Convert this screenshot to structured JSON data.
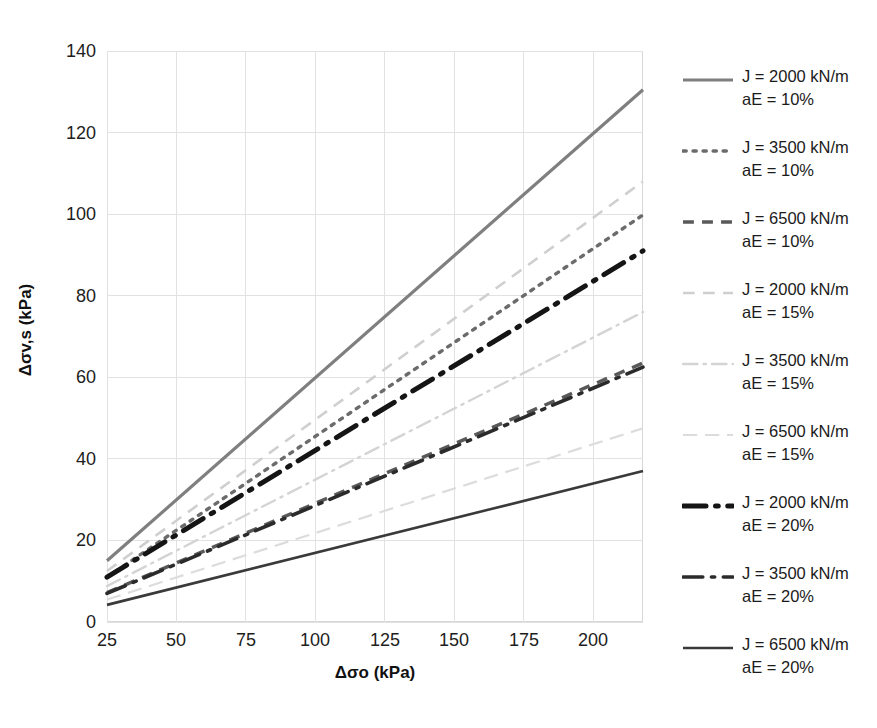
{
  "chart_data": {
    "type": "line",
    "title": "",
    "xlabel": "Δσo (kPa)",
    "ylabel": "Δσv,s (kPa)",
    "xlim": [
      25,
      218
    ],
    "ylim": [
      0,
      140
    ],
    "xticks": [
      25,
      50,
      75,
      100,
      125,
      150,
      175,
      200
    ],
    "yticks": [
      0,
      20,
      40,
      60,
      80,
      100,
      120,
      140
    ],
    "grid": true,
    "legend_position": "right",
    "x": [
      25,
      218
    ],
    "series": [
      {
        "name": "J = 2000 kN/m aE = 10%",
        "J": "2000 kN/m",
        "aE": "10%",
        "style": "solid",
        "color": "#7f7f7f",
        "width": 3.2,
        "values": [
          15.0,
          130.5
        ]
      },
      {
        "name": "J = 3500 kN/m aE = 10%",
        "J": "3500 kN/m",
        "aE": "10%",
        "style": "dotted",
        "color": "#6b6b6b",
        "width": 3.4,
        "values": [
          11.0,
          99.8
        ]
      },
      {
        "name": "J = 6500 kN/m aE = 10%",
        "J": "6500 kN/m",
        "aE": "10%",
        "style": "dashed",
        "color": "#595959",
        "width": 3.4,
        "values": [
          7.2,
          63.5
        ]
      },
      {
        "name": "J = 2000 kN/m aE = 15%",
        "J": "2000 kN/m",
        "aE": "15%",
        "style": "dashed-light",
        "color": "#cfcfcf",
        "width": 2.6,
        "values": [
          12.5,
          108.0
        ]
      },
      {
        "name": "J = 3500 kN/m aE = 15%",
        "J": "3500 kN/m",
        "aE": "15%",
        "style": "dashdot-light",
        "color": "#d4d4d4",
        "width": 2.4,
        "values": [
          8.8,
          76.0
        ]
      },
      {
        "name": "J = 6500 kN/m aE = 15%",
        "J": "6500 kN/m",
        "aE": "15%",
        "style": "longdash-light",
        "color": "#dcdcdc",
        "width": 2.2,
        "values": [
          5.5,
          47.5
        ]
      },
      {
        "name": "J = 2000 kN/m aE = 20%",
        "J": "2000 kN/m",
        "aE": "20%",
        "style": "dashdot-bold",
        "color": "#151515",
        "width": 5.0,
        "values": [
          11.0,
          91.0
        ]
      },
      {
        "name": "J = 3500 kN/m aE = 20%",
        "J": "3500 kN/m",
        "aE": "20%",
        "style": "dashdot",
        "color": "#2b2b2b",
        "width": 3.6,
        "values": [
          7.0,
          62.5
        ]
      },
      {
        "name": "J = 6500 kN/m aE = 20%",
        "J": "6500 kN/m",
        "aE": "20%",
        "style": "solid-dark",
        "color": "#3a3a3a",
        "width": 2.6,
        "values": [
          4.2,
          37.0
        ]
      }
    ]
  },
  "axes": {
    "x_title": "Δσo (kPa)",
    "y_title_main": "Δσv,s (kPa)",
    "xticks": [
      "25",
      "50",
      "75",
      "100",
      "125",
      "150",
      "175",
      "200"
    ],
    "yticks": [
      "140",
      "120",
      "100",
      "80",
      "60",
      "40",
      "20",
      "0"
    ]
  },
  "legend": {
    "entries": [
      {
        "line1": "J = 2000 kN/m",
        "line2": "aE = 10%"
      },
      {
        "line1": "J = 3500 kN/m",
        "line2": "aE = 10%"
      },
      {
        "line1": "J = 6500 kN/m",
        "line2": "aE = 10%"
      },
      {
        "line1": "J = 2000 kN/m",
        "line2": "aE = 15%"
      },
      {
        "line1": "J = 3500 kN/m",
        "line2": "aE = 15%"
      },
      {
        "line1": "J = 6500 kN/m",
        "line2": "aE = 15%"
      },
      {
        "line1": "J = 2000 kN/m",
        "line2": "aE = 20%"
      },
      {
        "line1": "J = 3500 kN/m",
        "line2": "aE = 20%"
      },
      {
        "line1": "J = 6500 kN/m",
        "line2": "aE = 20%"
      }
    ]
  },
  "footer": {
    "smudge": ""
  }
}
